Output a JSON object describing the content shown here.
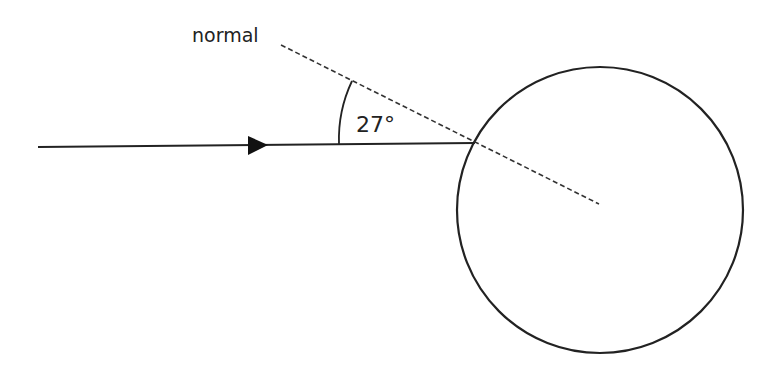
{
  "diagram": {
    "normal_label": "normal",
    "angle_label": "27°",
    "angle_degrees": 27,
    "stroke_color": "#222222",
    "background": "#ffffff",
    "incident_ray": {
      "x1": 38,
      "y1": 147,
      "x2": 475,
      "y2": 143
    },
    "normal_line": {
      "x1": 281,
      "y1": 45,
      "x2": 599,
      "y2": 204
    },
    "circle": {
      "cx": 600,
      "cy": 210,
      "r": 143
    },
    "arrowhead": {
      "tip_x": 268,
      "tip_y": 145
    }
  }
}
